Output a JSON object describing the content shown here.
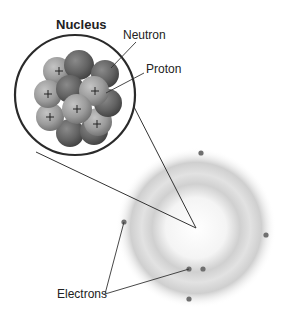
{
  "diagram": {
    "title": "Nucleus",
    "labels": {
      "nucleus": "Nucleus",
      "neutron": "Neutron",
      "proton": "Proton",
      "electrons": "Electrons"
    },
    "proton_symbol": "+",
    "colors": {
      "outline": "#2a2a2a",
      "proton": "#9a9a9a",
      "neutron": "#6a6a6a",
      "electron": "#6f6f6f",
      "cloud": "#c8c8c8"
    },
    "electron_count": 6
  }
}
